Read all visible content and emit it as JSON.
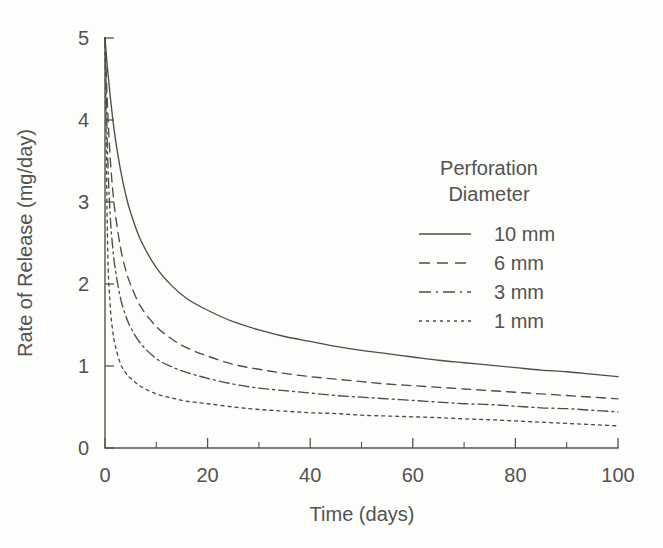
{
  "chart_data": {
    "type": "line",
    "title": "",
    "xlabel": "Time (days)",
    "ylabel": "Rate of Release (mg/day)",
    "xlim": [
      0,
      100
    ],
    "ylim": [
      0,
      5
    ],
    "xticks": [
      0,
      20,
      40,
      60,
      80,
      100
    ],
    "xtick_labels": [
      "0",
      "20",
      "40",
      "60",
      "80",
      "100"
    ],
    "xminor_ticks": [
      10,
      30,
      50,
      70,
      90
    ],
    "yticks": [
      0,
      1,
      2,
      3,
      4,
      5
    ],
    "ytick_labels": [
      "0",
      "1",
      "2",
      "3",
      "4",
      "5"
    ],
    "grid": false,
    "legend_position": "upper-right-inside",
    "legend_title_lines": [
      "Perforation",
      "Diameter"
    ],
    "x": [
      0,
      0.5,
      1,
      1.5,
      2,
      3,
      4,
      5,
      7,
      10,
      13,
      16,
      20,
      25,
      30,
      35,
      40,
      45,
      50,
      55,
      60,
      65,
      70,
      75,
      80,
      85,
      90,
      95,
      100
    ],
    "series": [
      {
        "name": "10 mm",
        "style": "solid",
        "color": "#4f4d4a",
        "values": [
          5.0,
          4.62,
          4.3,
          4.02,
          3.78,
          3.4,
          3.1,
          2.87,
          2.53,
          2.2,
          1.98,
          1.82,
          1.68,
          1.54,
          1.44,
          1.36,
          1.3,
          1.24,
          1.19,
          1.15,
          1.11,
          1.07,
          1.04,
          1.01,
          0.98,
          0.95,
          0.93,
          0.9,
          0.87
        ]
      },
      {
        "name": "6 mm",
        "style": "dashed",
        "color": "#4f4d4a",
        "values": [
          5.0,
          4.15,
          3.55,
          3.15,
          2.86,
          2.45,
          2.18,
          1.99,
          1.72,
          1.48,
          1.33,
          1.22,
          1.12,
          1.02,
          0.96,
          0.91,
          0.87,
          0.84,
          0.81,
          0.78,
          0.76,
          0.74,
          0.72,
          0.7,
          0.68,
          0.66,
          0.64,
          0.62,
          0.6
        ]
      },
      {
        "name": "3 mm",
        "style": "dash-dot",
        "color": "#4f4d4a",
        "values": [
          5.0,
          3.6,
          2.85,
          2.45,
          2.18,
          1.83,
          1.62,
          1.47,
          1.27,
          1.09,
          0.99,
          0.92,
          0.85,
          0.78,
          0.73,
          0.7,
          0.67,
          0.64,
          0.62,
          0.6,
          0.58,
          0.56,
          0.54,
          0.53,
          0.51,
          0.49,
          0.48,
          0.46,
          0.44
        ]
      },
      {
        "name": "1 mm",
        "style": "dotted",
        "color": "#4f4d4a",
        "values": [
          5.0,
          2.5,
          1.75,
          1.43,
          1.25,
          1.03,
          0.92,
          0.85,
          0.75,
          0.66,
          0.61,
          0.57,
          0.54,
          0.5,
          0.47,
          0.45,
          0.43,
          0.42,
          0.4,
          0.39,
          0.38,
          0.37,
          0.355,
          0.345,
          0.33,
          0.315,
          0.3,
          0.285,
          0.27
        ]
      }
    ]
  },
  "legend": {
    "title_line1": "Perforation",
    "title_line2": "Diameter",
    "entries": [
      {
        "label": "10 mm",
        "style": "solid"
      },
      {
        "label": "6 mm",
        "style": "dashed"
      },
      {
        "label": "3 mm",
        "style": "dash-dot"
      },
      {
        "label": "1 mm",
        "style": "dotted"
      }
    ]
  },
  "axes": {
    "x_title": "Time (days)",
    "y_title": "Rate of Release (mg/day)"
  },
  "colors": {
    "ink": "#4f4d4a",
    "axis": "#555350",
    "text": "#545250",
    "background": "#fdfdfc"
  }
}
